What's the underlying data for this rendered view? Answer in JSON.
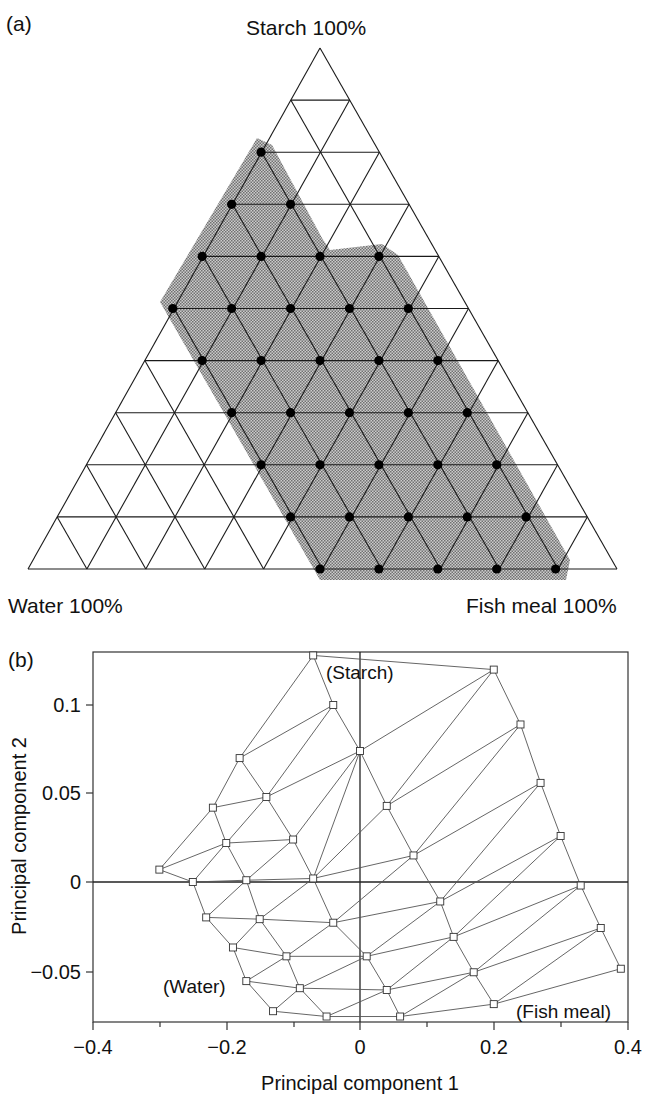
{
  "panel_a": {
    "label": "(a)",
    "vertex_labels": {
      "top": "Starch 100%",
      "bottom_left": "Water 100%",
      "bottom_right": "Fish meal 100%"
    }
  },
  "panel_b": {
    "label": "(b)",
    "xlabel": "Principal component 1",
    "ylabel": "Principal component 2",
    "x_ticks": [
      "−0.4",
      "−0.2",
      "0",
      "0.2",
      "0.4"
    ],
    "y_ticks": [
      "0.1",
      "0.05",
      "0",
      "−0.05"
    ],
    "annotations": {
      "starch": "(Starch)",
      "water": "(Water)",
      "fish_meal": "(Fish meal)"
    }
  },
  "chart_data": [
    {
      "type": "scatter",
      "title": "(a) Ternary mixture design",
      "subtype": "ternary",
      "vertices": [
        "Starch 100%",
        "Water 100%",
        "Fish meal 100%"
      ],
      "grid_divisions": 10,
      "grid": true,
      "shaded_region": "experimental design region (dotted gray)",
      "design_points_count": 35,
      "design_points_rows_from_top": [
        {
          "row": 3,
          "count": 1
        },
        {
          "row": 4,
          "count": 2
        },
        {
          "row": 5,
          "count": 4
        },
        {
          "row": 6,
          "count": 5
        },
        {
          "row": 7,
          "count": 5
        },
        {
          "row": 8,
          "count": 5
        },
        {
          "row": 9,
          "count": 5
        },
        {
          "row": 10,
          "count": 5
        },
        {
          "row": 10,
          "note": "bottom edge",
          "count": 5
        }
      ]
    },
    {
      "type": "scatter",
      "title": "(b) Principal component score plot",
      "xlabel": "Principal component 1",
      "ylabel": "Principal component 2",
      "xlim": [
        -0.4,
        0.4
      ],
      "ylim": [
        -0.079,
        0.13
      ],
      "x_ticks": [
        -0.4,
        -0.2,
        0,
        0.2,
        0.4
      ],
      "y_ticks": [
        0.1,
        0.05,
        0,
        -0.05
      ],
      "zero_lines": true,
      "marker": "open square",
      "connected_as_mesh": true,
      "annotations": [
        {
          "text": "(Starch)",
          "x": -0.02,
          "y": 0.118
        },
        {
          "text": "(Water)",
          "x": -0.24,
          "y": -0.056
        },
        {
          "text": "(Fish meal)",
          "x": 0.3,
          "y": -0.07
        }
      ],
      "points": [
        {
          "x": -0.07,
          "y": 0.128
        },
        {
          "x": -0.04,
          "y": 0.1
        },
        {
          "x": 0.0,
          "y": 0.074
        },
        {
          "x": -0.18,
          "y": 0.07
        },
        {
          "x": -0.14,
          "y": 0.048
        },
        {
          "x": -0.1,
          "y": 0.024
        },
        {
          "x": -0.22,
          "y": 0.042
        },
        {
          "x": -0.2,
          "y": 0.022
        },
        {
          "x": -0.17,
          "y": 0.001
        },
        {
          "x": -0.3,
          "y": 0.007
        },
        {
          "x": -0.25,
          "y": 0.0
        },
        {
          "x": -0.07,
          "y": 0.002
        },
        {
          "x": -0.23,
          "y": -0.02
        },
        {
          "x": -0.15,
          "y": -0.021
        },
        {
          "x": -0.04,
          "y": -0.023
        },
        {
          "x": -0.19,
          "y": -0.037
        },
        {
          "x": -0.11,
          "y": -0.042
        },
        {
          "x": 0.01,
          "y": -0.042
        },
        {
          "x": -0.17,
          "y": -0.056
        },
        {
          "x": -0.09,
          "y": -0.06
        },
        {
          "x": 0.04,
          "y": -0.061
        },
        {
          "x": -0.13,
          "y": -0.073
        },
        {
          "x": -0.05,
          "y": -0.076
        },
        {
          "x": 0.06,
          "y": -0.076
        },
        {
          "x": 0.04,
          "y": 0.043
        },
        {
          "x": 0.08,
          "y": 0.015
        },
        {
          "x": 0.12,
          "y": -0.011
        },
        {
          "x": 0.14,
          "y": -0.031
        },
        {
          "x": 0.17,
          "y": -0.051
        },
        {
          "x": 0.2,
          "y": -0.069
        },
        {
          "x": 0.2,
          "y": 0.12
        },
        {
          "x": 0.24,
          "y": 0.089
        },
        {
          "x": 0.27,
          "y": 0.056
        },
        {
          "x": 0.3,
          "y": 0.026
        },
        {
          "x": 0.33,
          "y": -0.002
        },
        {
          "x": 0.36,
          "y": -0.026
        },
        {
          "x": 0.39,
          "y": -0.049
        }
      ]
    }
  ]
}
